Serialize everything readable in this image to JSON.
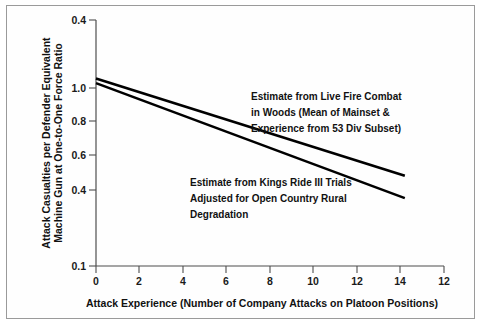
{
  "chart_data": {
    "type": "line",
    "title": "",
    "xlabel": "Attack Experience (Number of Company Attacks on Platoon Positions)",
    "ylabel": "Attack Casualties per Defender Equivalent Machine Gun at One-to-One Force Ratio",
    "yscale": "log",
    "xlim": [
      0,
      16
    ],
    "ylim": [
      0.1,
      2.0
    ],
    "grid": false,
    "legend": "none (inline annotations)",
    "xticks": [
      {
        "value": 0,
        "label": "0"
      },
      {
        "value": 2,
        "label": "2"
      },
      {
        "value": 4,
        "label": "4"
      },
      {
        "value": 6,
        "label": "6"
      },
      {
        "value": 8,
        "label": "8"
      },
      {
        "value": 10,
        "label": "10"
      },
      {
        "value": 12,
        "label": "12"
      },
      {
        "value": 14,
        "label": "14"
      },
      {
        "value": 16,
        "label": "12"
      }
    ],
    "yticks": [
      {
        "value": 2.0,
        "label": "0.4"
      },
      {
        "value": 1.0,
        "label": "1.0"
      },
      {
        "value": 0.8,
        "label": "0.8"
      },
      {
        "value": 0.6,
        "label": "0.6"
      },
      {
        "value": 0.4,
        "label": "0.4"
      },
      {
        "value": 0.1,
        "label": "0.1"
      }
    ],
    "series": [
      {
        "name": "Estimate from Live Fire Combat in Woods",
        "points": [
          [
            0,
            1.09
          ],
          [
            14.2,
            0.455
          ]
        ]
      },
      {
        "name": "Estimate from Kings Ride III Trials",
        "points": [
          [
            0,
            1.045
          ],
          [
            14.2,
            0.372
          ]
        ]
      }
    ],
    "annotations": [
      {
        "id": "live-fire-combat",
        "lines": [
          "Estimate from Live Fire Combat",
          "in Woods (Mean of Mainset &",
          "Experience from 53 Div Subset)"
        ]
      },
      {
        "id": "kings-ride",
        "lines": [
          "Estimate from Kings Ride III Trials",
          "Adjusted for Open Country Rural",
          "Degradation"
        ]
      }
    ],
    "colors": {
      "line": "#000000",
      "axis": "#4d4d4d",
      "text": "#111111",
      "background": "#ffffff",
      "frame": "#9a9a9a"
    }
  }
}
